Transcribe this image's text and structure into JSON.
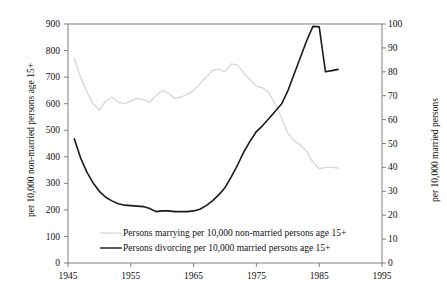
{
  "chart_data": {
    "type": "line",
    "title": "",
    "subtitle": "",
    "xlabel": "",
    "ylabel": "per 10,000 non-married persons age 15+",
    "ylabel_right": "per 10,000 married persons",
    "xlim": [
      1945,
      1995
    ],
    "ylim": [
      0,
      900
    ],
    "ylim_right": [
      0,
      100
    ],
    "grid": false,
    "legend_position": "inside-bottom-center",
    "x_ticks": [
      "1945",
      "1955",
      "1965",
      "1975",
      "1985",
      "1995"
    ],
    "x_tick_values": [
      1945,
      1955,
      1965,
      1975,
      1985,
      1995
    ],
    "y_ticks_left": [
      "0",
      "100",
      "200",
      "300",
      "400",
      "500",
      "600",
      "700",
      "800",
      "900"
    ],
    "y_tick_values_left": [
      0,
      100,
      200,
      300,
      400,
      500,
      600,
      700,
      800,
      900
    ],
    "y_ticks_right": [
      "0",
      "10",
      "20",
      "30",
      "40",
      "50",
      "60",
      "70",
      "80",
      "90",
      "100"
    ],
    "y_tick_values_right": [
      0,
      10,
      20,
      30,
      40,
      50,
      60,
      70,
      80,
      90,
      100
    ],
    "series": [
      {
        "name": "Persons marrying per 10,000 non-married persons age 15+",
        "axis": "left",
        "color": "#d9d9d9",
        "x": [
          1946,
          1947,
          1948,
          1949,
          1950,
          1951,
          1952,
          1953,
          1954,
          1955,
          1956,
          1957,
          1958,
          1959,
          1960,
          1961,
          1962,
          1963,
          1964,
          1965,
          1966,
          1967,
          1968,
          1969,
          1970,
          1971,
          1972,
          1973,
          1974,
          1975,
          1976,
          1977,
          1978,
          1979,
          1980,
          1981,
          1982,
          1983,
          1984,
          1985,
          1986,
          1987,
          1988
        ],
        "y": [
          770,
          700,
          645,
          600,
          575,
          610,
          625,
          605,
          600,
          610,
          620,
          615,
          605,
          630,
          650,
          640,
          620,
          625,
          635,
          650,
          675,
          700,
          725,
          730,
          720,
          750,
          745,
          715,
          690,
          665,
          660,
          640,
          600,
          545,
          490,
          460,
          445,
          420,
          380,
          355,
          360,
          360,
          358
        ]
      },
      {
        "name": "Persons divorcing per 10,000 married persons age 15+",
        "axis": "right",
        "color": "#1a1a1a",
        "x": [
          1946,
          1947,
          1948,
          1949,
          1950,
          1951,
          1952,
          1953,
          1954,
          1955,
          1956,
          1957,
          1958,
          1959,
          1960,
          1961,
          1962,
          1963,
          1964,
          1965,
          1966,
          1967,
          1968,
          1969,
          1970,
          1971,
          1972,
          1973,
          1974,
          1975,
          1976,
          1977,
          1978,
          1979,
          1980,
          1981,
          1982,
          1983,
          1984,
          1985,
          1986,
          1987,
          1988
        ],
        "y": [
          52.0,
          44.0,
          38.0,
          33.5,
          30.0,
          27.5,
          26.0,
          24.8,
          24.2,
          24.0,
          23.8,
          23.6,
          22.8,
          21.5,
          21.8,
          21.8,
          21.5,
          21.5,
          21.5,
          21.8,
          22.5,
          24.0,
          26.0,
          28.5,
          31.5,
          36.0,
          41.0,
          46.5,
          51.0,
          55.0,
          57.5,
          60.5,
          63.5,
          66.5,
          72.0,
          79.0,
          86.0,
          93.0,
          99.0,
          98.8,
          80.0,
          80.5,
          81.0
        ]
      }
    ],
    "annotations": []
  },
  "legend": {
    "items": [
      {
        "label": "Persons marrying per 10,000 non-married persons age 15+",
        "color": "#d9d9d9"
      },
      {
        "label": "Persons divorcing per 10,000 married persons age 15+",
        "color": "#1a1a1a"
      }
    ]
  },
  "axes": {
    "left_title": "per 10,000 non-married persons age 15+",
    "right_title": "per 10,000 married persons"
  }
}
